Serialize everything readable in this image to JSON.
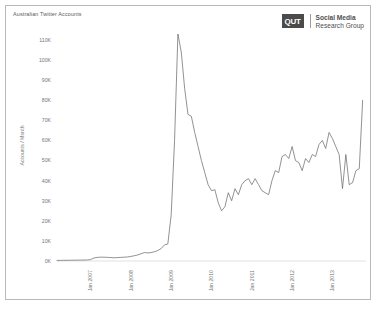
{
  "figure": {
    "title": "Australian Twitter Accounts",
    "brand": {
      "mark": "QUT",
      "line1": "Social Media",
      "line2": "Research Group"
    }
  },
  "chart_data": {
    "type": "line",
    "title": "Australian Twitter Accounts",
    "xlabel": "",
    "ylabel": "Accounts / Month",
    "ylim": [
      0,
      115000
    ],
    "yticks": [
      0,
      10000,
      20000,
      30000,
      40000,
      50000,
      60000,
      70000,
      80000,
      90000,
      100000,
      110000
    ],
    "ytick_labels": [
      "0K",
      "10K",
      "20K",
      "30K",
      "40K",
      "50K",
      "60K",
      "70K",
      "80K",
      "90K",
      "100K",
      "110K"
    ],
    "xtick_labels": [
      "Jan 2007",
      "Jan 2008",
      "Jan 2009",
      "Jan 2010",
      "Jan 2011",
      "Jan 2012",
      "Jan 2013"
    ],
    "xtick_x": [
      "2007-01",
      "2008-01",
      "2009-01",
      "2010-01",
      "2011-01",
      "2012-01",
      "2013-01"
    ],
    "xlim": [
      "2006-03",
      "2013-11"
    ],
    "grid": false,
    "legend": "none",
    "series": [
      {
        "name": "Australian Twitter Accounts",
        "color": "#6e6e6e",
        "x": [
          "2006-03",
          "2006-04",
          "2006-05",
          "2006-06",
          "2006-07",
          "2006-08",
          "2006-09",
          "2006-10",
          "2006-11",
          "2006-12",
          "2007-01",
          "2007-02",
          "2007-03",
          "2007-04",
          "2007-05",
          "2007-06",
          "2007-07",
          "2007-08",
          "2007-09",
          "2007-10",
          "2007-11",
          "2007-12",
          "2008-01",
          "2008-02",
          "2008-03",
          "2008-04",
          "2008-05",
          "2008-06",
          "2008-07",
          "2008-08",
          "2008-09",
          "2008-10",
          "2008-11",
          "2008-12",
          "2009-01",
          "2009-02",
          "2009-03",
          "2009-04",
          "2009-05",
          "2009-06",
          "2009-07",
          "2009-08",
          "2009-09",
          "2009-10",
          "2009-11",
          "2009-12",
          "2010-01",
          "2010-02",
          "2010-03",
          "2010-04",
          "2010-05",
          "2010-06",
          "2010-07",
          "2010-08",
          "2010-09",
          "2010-10",
          "2010-11",
          "2010-12",
          "2011-01",
          "2011-02",
          "2011-03",
          "2011-04",
          "2011-05",
          "2011-06",
          "2011-07",
          "2011-08",
          "2011-09",
          "2011-10",
          "2011-11",
          "2011-12",
          "2012-01",
          "2012-02",
          "2012-03",
          "2012-04",
          "2012-05",
          "2012-06",
          "2012-07",
          "2012-08",
          "2012-09",
          "2012-10",
          "2012-11",
          "2012-12",
          "2013-01",
          "2013-02",
          "2013-03",
          "2013-04",
          "2013-05",
          "2013-06",
          "2013-07",
          "2013-08",
          "2013-09",
          "2013-10"
        ],
        "values": [
          300,
          320,
          340,
          360,
          380,
          400,
          430,
          450,
          480,
          520,
          700,
          1500,
          1800,
          1900,
          1900,
          1800,
          1700,
          1600,
          1700,
          1800,
          1900,
          2000,
          2300,
          2600,
          3000,
          3600,
          4200,
          4000,
          4200,
          4600,
          5200,
          6200,
          8000,
          8500,
          23000,
          60000,
          113000,
          104000,
          86000,
          73000,
          72000,
          64000,
          57000,
          50000,
          44000,
          38000,
          35000,
          35500,
          29000,
          25000,
          27000,
          34000,
          30000,
          36000,
          33000,
          38000,
          40000,
          41000,
          38000,
          41000,
          38000,
          35000,
          34000,
          33000,
          40000,
          45000,
          44000,
          52000,
          53000,
          51000,
          57000,
          50000,
          49000,
          45000,
          51000,
          49000,
          53000,
          52000,
          58000,
          60000,
          56000,
          64000,
          61000,
          57000,
          53000,
          36000,
          53000,
          38000,
          39000,
          45000,
          46000,
          80000
        ]
      }
    ]
  }
}
